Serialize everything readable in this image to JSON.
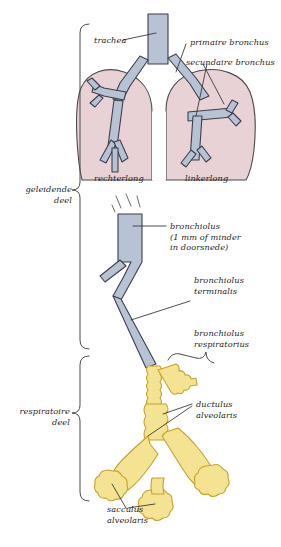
{
  "figure": {
    "language": "nl",
    "colors": {
      "lung_fill": "#e9d2d6",
      "lung_outline": "#3b3b3b",
      "bronchus_fill": "#b7c3d4",
      "bronchus_outline": "#3a3f4a",
      "alveolar_fill": "#f4e392",
      "alveolar_outline": "#c8a12c",
      "leader_line": "#3a3a3a",
      "bracket": "#4a4a4a",
      "text": "#1c1c1c",
      "background": "#ffffff"
    }
  },
  "brackets": [
    {
      "id": "conducting",
      "label_line1": "geleidende",
      "label_line2": "deel"
    },
    {
      "id": "respiratory",
      "label_line1": "respiratoire",
      "label_line2": "deel"
    }
  ],
  "labels": {
    "trachea": "trachea",
    "primaire_bronchus": "primaire bronchus",
    "secundaire_bronchus": "secundaire bronchus",
    "rechterlong": "rechterlong",
    "linkerlong": "linkerlong",
    "bronchiolus": "bronchiolus",
    "bronchiolus_note_line1": "(1 mm of minder",
    "bronchiolus_note_line2": "in doorsnede)",
    "bronchiolus_terminalis_line1": "bronchiolus",
    "bronchiolus_terminalis_line2": "terminalis",
    "bronchiolus_respiratorius_line1": "bronchiolus",
    "bronchiolus_respiratorius_line2": "respiratorius",
    "ductulus_alveolaris_line1": "ductulus",
    "ductulus_alveolaris_line2": "alveolaris",
    "sacculus_alveolaris_line1": "sacculus",
    "sacculus_alveolaris_line2": "alveolaris"
  }
}
